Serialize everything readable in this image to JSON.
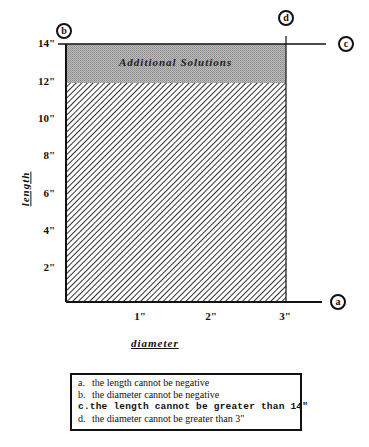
{
  "diagram": {
    "region_label": "Additional Solutions",
    "x_axis": {
      "title": "diameter",
      "ticks": [
        "1\"",
        "2\"",
        "3\""
      ]
    },
    "y_axis": {
      "title": "length",
      "ticks": [
        "2\"",
        "4\"",
        "6\"",
        "8\"",
        "10\"",
        "12\"",
        "14\""
      ]
    },
    "constraint_markers": [
      "a",
      "b",
      "c",
      "d"
    ],
    "colors": {
      "hatch": "#333333",
      "additional_band": "#a8a8a8",
      "line": "#111111"
    }
  },
  "legend": {
    "items": [
      {
        "key": "a.",
        "text": "the length cannot be negative",
        "emphasis": false
      },
      {
        "key": "b.",
        "text": "the diameter cannot be negative",
        "emphasis": false
      },
      {
        "key": "c.",
        "text": "the length cannot be greater than 14\"",
        "emphasis": true
      },
      {
        "key": "d.",
        "text": "the diameter cannot be greater than 3\"",
        "emphasis": false
      }
    ]
  }
}
